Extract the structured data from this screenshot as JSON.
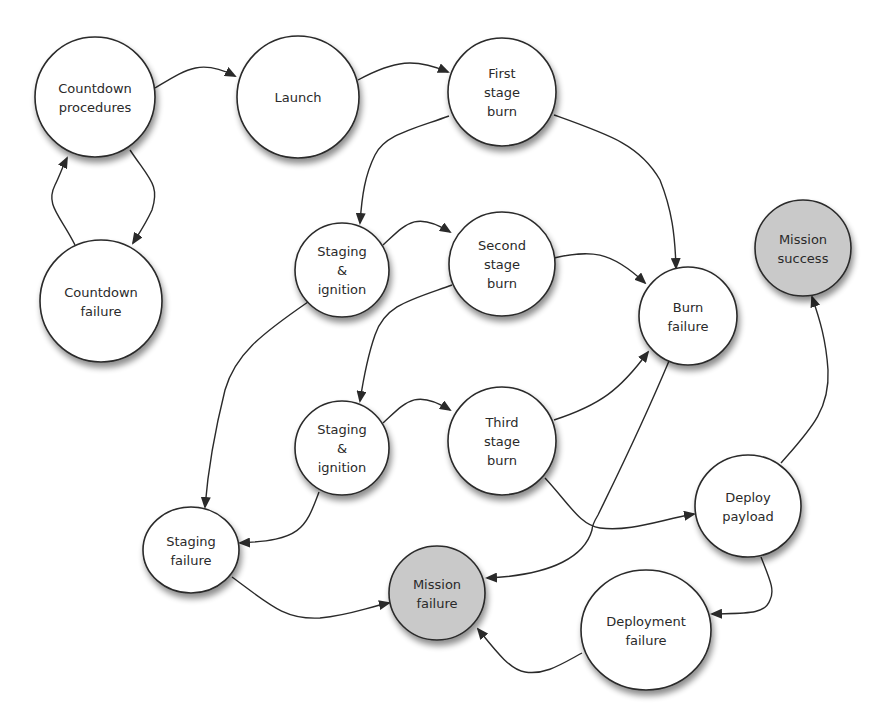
{
  "diagram": {
    "type": "state-transition",
    "colors": {
      "node_fill": "#ffffff",
      "terminal_fill": "#c9c9c9",
      "stroke": "#2a2a2a"
    },
    "nodes": [
      {
        "id": "countdown_procedures",
        "lines": [
          "Countdown",
          "procedures"
        ],
        "cx": 95,
        "cy": 97,
        "rx": 60,
        "ry": 60,
        "terminal": false
      },
      {
        "id": "launch",
        "lines": [
          "Launch"
        ],
        "cx": 298,
        "cy": 97,
        "rx": 61,
        "ry": 61,
        "terminal": false
      },
      {
        "id": "first_stage_burn",
        "lines": [
          "First",
          "stage",
          "burn"
        ],
        "cx": 502,
        "cy": 92,
        "rx": 54,
        "ry": 54,
        "terminal": false
      },
      {
        "id": "countdown_failure",
        "lines": [
          "Countdown",
          "failure"
        ],
        "cx": 101,
        "cy": 301,
        "rx": 61,
        "ry": 61,
        "terminal": false
      },
      {
        "id": "staging_ignition_1",
        "lines": [
          "Staging",
          "&",
          "ignition"
        ],
        "cx": 342,
        "cy": 270,
        "rx": 47,
        "ry": 47,
        "terminal": false
      },
      {
        "id": "second_stage_burn",
        "lines": [
          "Second",
          "stage",
          "burn"
        ],
        "cx": 502,
        "cy": 264,
        "rx": 53,
        "ry": 52,
        "terminal": false
      },
      {
        "id": "burn_failure",
        "lines": [
          "Burn",
          "failure"
        ],
        "cx": 688,
        "cy": 316,
        "rx": 49,
        "ry": 49,
        "terminal": false
      },
      {
        "id": "mission_success",
        "lines": [
          "Mission",
          "success"
        ],
        "cx": 803,
        "cy": 248,
        "rx": 48,
        "ry": 48,
        "terminal": true
      },
      {
        "id": "staging_ignition_2",
        "lines": [
          "Staging",
          "&",
          "ignition"
        ],
        "cx": 342,
        "cy": 448,
        "rx": 47,
        "ry": 47,
        "terminal": false
      },
      {
        "id": "third_stage_burn",
        "lines": [
          "Third",
          "stage",
          "burn"
        ],
        "cx": 502,
        "cy": 441,
        "rx": 54,
        "ry": 54,
        "terminal": false
      },
      {
        "id": "deploy_payload",
        "lines": [
          "Deploy",
          "payload"
        ],
        "cx": 748,
        "cy": 506,
        "rx": 53,
        "ry": 51,
        "terminal": false
      },
      {
        "id": "staging_failure",
        "lines": [
          "Staging",
          "failure"
        ],
        "cx": 191,
        "cy": 550,
        "rx": 48,
        "ry": 43,
        "terminal": false
      },
      {
        "id": "mission_failure",
        "lines": [
          "Mission",
          "failure"
        ],
        "cx": 437,
        "cy": 593,
        "rx": 48,
        "ry": 47,
        "terminal": true
      },
      {
        "id": "deployment_failure",
        "lines": [
          "Deployment",
          "failure"
        ],
        "cx": 646,
        "cy": 630,
        "rx": 65,
        "ry": 60,
        "terminal": false
      }
    ],
    "edges": [
      {
        "from": "countdown_procedures",
        "to": "launch",
        "d": "M155,88 C185,70 200,58 235,76"
      },
      {
        "from": "launch",
        "to": "first_stage_burn",
        "d": "M358,80 C395,60 415,58 448,72"
      },
      {
        "from": "countdown_procedures",
        "to": "countdown_failure",
        "d": "M130,150 C150,180 160,185 152,210 C145,225 140,232 133,243"
      },
      {
        "from": "countdown_failure",
        "to": "countdown_procedures",
        "d": "M75,245 C60,215 45,205 55,185 C60,175 62,168 67,158"
      },
      {
        "from": "first_stage_burn",
        "to": "staging_ignition_1",
        "d": "M449,116 C410,130 385,135 375,155 C365,175 362,195 360,223"
      },
      {
        "from": "first_stage_burn",
        "to": "burn_failure",
        "d": "M554,115 C610,135 640,145 660,180 C672,210 675,235 676,268"
      },
      {
        "from": "staging_ignition_1",
        "to": "second_stage_burn",
        "d": "M383,245 C405,225 415,210 450,232"
      },
      {
        "from": "second_stage_burn",
        "to": "burn_failure",
        "d": "M554,258 C590,250 610,250 645,283"
      },
      {
        "from": "second_stage_burn",
        "to": "staging_ignition_2",
        "d": "M452,285 C410,300 385,305 375,335 C368,355 364,375 360,401"
      },
      {
        "from": "staging_ignition_1",
        "to": "staging_failure",
        "d": "M308,302 C260,335 235,355 225,390 C215,430 208,470 205,507"
      },
      {
        "from": "staging_ignition_2",
        "to": "third_stage_burn",
        "d": "M383,423 C405,403 415,388 450,410"
      },
      {
        "from": "third_stage_burn",
        "to": "burn_failure",
        "d": "M554,420 C600,405 620,390 648,352"
      },
      {
        "from": "third_stage_burn",
        "to": "deploy_payload",
        "d": "M545,478 C570,505 580,525 600,528 C630,532 660,520 694,514"
      },
      {
        "from": "burn_failure",
        "to": "mission_failure",
        "d": "M669,361 C640,430 615,480 598,515 C595,520 592,525 592,530 C585,555 555,575 487,578"
      },
      {
        "from": "staging_ignition_2",
        "to": "staging_failure",
        "d": "M319,492 C305,530 300,540 240,543"
      },
      {
        "from": "staging_failure",
        "to": "mission_failure",
        "d": "M232,577 C270,605 285,620 320,618 C350,615 365,608 389,603"
      },
      {
        "from": "deploy_payload",
        "to": "mission_success",
        "d": "M781,463 C810,430 830,410 828,370 C826,340 820,320 812,297"
      },
      {
        "from": "deploy_payload",
        "to": "deployment_failure",
        "d": "M761,557 C770,580 775,590 770,600 C765,615 745,613 712,614"
      },
      {
        "from": "deployment_failure",
        "to": "mission_failure",
        "d": "M582,653 C560,665 545,675 525,672 C510,670 495,650 478,629"
      }
    ]
  }
}
